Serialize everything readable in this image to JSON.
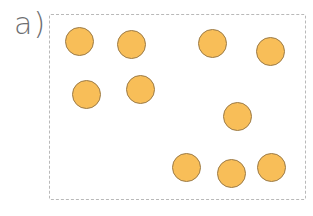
{
  "label": "a)",
  "colors": {
    "dot_fill": "#f8be58",
    "dot_stroke": "#9b7b48",
    "frame": "#b9b9b9",
    "label": "#6d6e71"
  },
  "dot_count": 10,
  "dots": [
    {
      "cx": 79,
      "cy": 41
    },
    {
      "cx": 131,
      "cy": 44
    },
    {
      "cx": 212,
      "cy": 43
    },
    {
      "cx": 270,
      "cy": 51
    },
    {
      "cx": 86,
      "cy": 94
    },
    {
      "cx": 140,
      "cy": 89
    },
    {
      "cx": 237,
      "cy": 116
    },
    {
      "cx": 186,
      "cy": 167
    },
    {
      "cx": 231,
      "cy": 173
    },
    {
      "cx": 271,
      "cy": 167
    }
  ]
}
